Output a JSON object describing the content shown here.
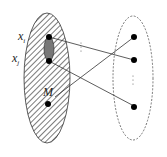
{
  "diagram": {
    "left_set": {
      "style": "hatched",
      "labels": {
        "xi": "x",
        "xi_sub": "i",
        "xj": "x",
        "xj_sub": "j",
        "m": "M"
      }
    },
    "right_set": {
      "style": "dashed"
    },
    "edges": [
      {
        "from": "xi",
        "to": "right-2"
      },
      {
        "from": "xj",
        "to": "right-3"
      },
      {
        "from": "M",
        "to": "right-1"
      }
    ],
    "ellipsis": "⋮"
  }
}
